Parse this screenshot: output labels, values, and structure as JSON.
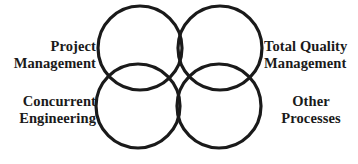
{
  "diagram": {
    "type": "four-circle-overlap-venn",
    "background_color": "#ffffff",
    "stroke_color": "#1a1a1a",
    "fill_color": "#ffffff",
    "text_color": "#1a1a1a",
    "circles": [
      {
        "name": "top-left",
        "cx": 48,
        "cy": 48,
        "r": 42
      },
      {
        "name": "top-right",
        "cx": 128,
        "cy": 48,
        "r": 42
      },
      {
        "name": "bottom-left",
        "cx": 46,
        "cy": 106,
        "r": 42
      },
      {
        "name": "bottom-right",
        "cx": 127,
        "cy": 106,
        "r": 42
      }
    ]
  },
  "labels": {
    "project_management": {
      "line1": "Project",
      "line2": "Management"
    },
    "total_quality_management": {
      "line1": "Total Quality",
      "line2": "Management"
    },
    "concurrent_engineering": {
      "line1": "Concurrent",
      "line2": "Engineering"
    },
    "other_processes": {
      "line1": "Other",
      "line2": "Processes"
    }
  }
}
